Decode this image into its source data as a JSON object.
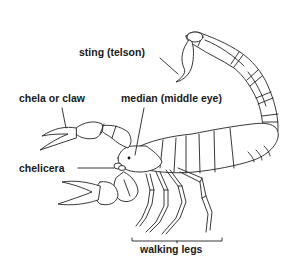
{
  "diagram": {
    "labels": {
      "sting": "sting (telson)",
      "chela": "chela or claw",
      "median_eye": "median (middle eye)",
      "chelicera": "chelicera",
      "walking_legs": "walking legs"
    },
    "colors": {
      "line": "#222222",
      "text": "#1a1a1a",
      "background": "#ffffff"
    }
  }
}
